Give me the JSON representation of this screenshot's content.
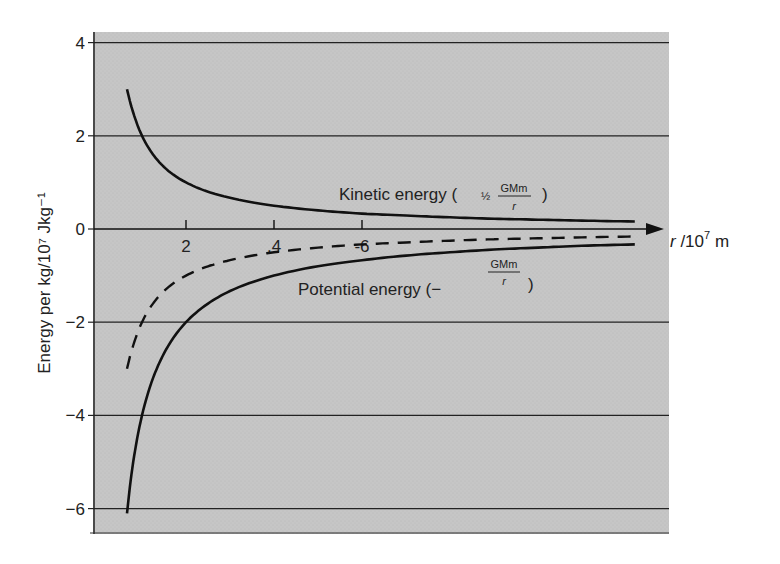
{
  "chart_data": {
    "type": "line",
    "title": "",
    "xlabel": "r /10^7 m",
    "ylabel": "Energy per kg/10^7 Jkg^-1",
    "xlim": [
      0,
      13
    ],
    "ylim": [
      -6.5,
      4.2
    ],
    "x_ticks": [
      "2",
      ".4",
      "-6"
    ],
    "x_tick_values": [
      2,
      4,
      6
    ],
    "y_ticks": [
      "4",
      "2",
      "0",
      "−2",
      "−4",
      "−6"
    ],
    "y_tick_values": [
      4,
      2,
      0,
      -2,
      -4,
      -6
    ],
    "grid": true,
    "legend_position": "inline annotations",
    "x": [
      0.66,
      0.8,
      1.0,
      1.25,
      1.5,
      2.0,
      2.5,
      3.0,
      4.0,
      5.0,
      6.0,
      7.0,
      8.0,
      9.0,
      10.0,
      11.0,
      12.2
    ],
    "series": [
      {
        "name": "Kinetic energy (½ GMm/r)",
        "style": "solid",
        "values": [
          3.0,
          2.5,
          2.0,
          1.6,
          1.33,
          1.0,
          0.8,
          0.67,
          0.5,
          0.4,
          0.33,
          0.29,
          0.25,
          0.22,
          0.2,
          0.18,
          0.16
        ]
      },
      {
        "name": "Potential energy (−GMm/r)",
        "style": "solid",
        "values": [
          -6.1,
          -5.0,
          -4.0,
          -3.2,
          -2.67,
          -2.0,
          -1.6,
          -1.33,
          -1.0,
          -0.8,
          -0.67,
          -0.57,
          -0.5,
          -0.44,
          -0.4,
          -0.36,
          -0.33
        ]
      },
      {
        "name": "Total energy",
        "style": "dashed",
        "values": [
          -3.0,
          -2.5,
          -2.0,
          -1.6,
          -1.33,
          -1.0,
          -0.8,
          -0.67,
          -0.5,
          -0.4,
          -0.33,
          -0.29,
          -0.25,
          -0.22,
          -0.2,
          -0.18,
          -0.16
        ]
      }
    ],
    "annotations": [
      {
        "text": "Kinetic energy (½ GMm/r)",
        "near_series": "Kinetic energy"
      },
      {
        "text": "Potential energy (−GMm/r)",
        "near_series": "Potential energy"
      }
    ]
  },
  "labels": {
    "ylabel": "Energy per kg/10⁷ Jkg⁻¹",
    "xlabel_r": "r",
    "xlabel_rest": " /10",
    "xlabel_exp": "7",
    "xlabel_unit": " m",
    "ke_prefix": "Kinetic energy (",
    "ke_half": "½",
    "ke_num": "GMm",
    "ke_den": "r",
    "ke_suffix": ")",
    "pe_prefix": "Potential energy (−",
    "pe_num": "GMm",
    "pe_den": "r",
    "pe_suffix": ")"
  },
  "colors": {
    "background": "#ffffff",
    "plot_area": "#c4c4c4",
    "lines": "#111111",
    "grid": "#222222"
  }
}
